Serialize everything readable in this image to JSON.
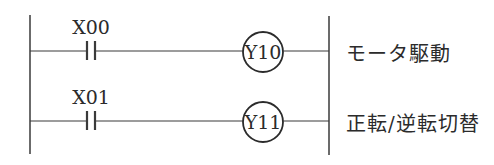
{
  "diagram": {
    "type": "ladder",
    "colors": {
      "line": "#3a3a3a",
      "text": "#2b2b2b",
      "background": "#ffffff"
    },
    "rungs": [
      {
        "contact": "X00",
        "coil": "Y10",
        "comment": "モータ駆動"
      },
      {
        "contact": "X01",
        "coil": "Y11",
        "comment": "正転/逆転切替"
      }
    ]
  }
}
